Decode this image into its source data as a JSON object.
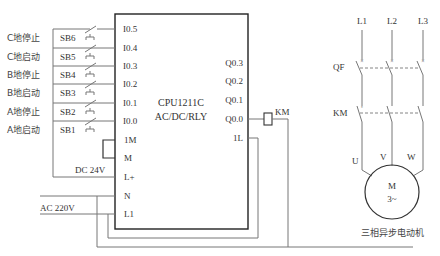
{
  "plc": {
    "model": "CPU1211C",
    "type": "AC/DC/RLY",
    "inputs": [
      "I0.5",
      "I0.4",
      "I0.3",
      "I0.2",
      "I0.1",
      "I0.0"
    ],
    "power_terminals": [
      "1M",
      "M",
      "L+",
      "N",
      "L1"
    ],
    "outputs": [
      "Q0.3",
      "Q0.2",
      "Q0.1",
      "Q0.0"
    ],
    "output_common": "1L"
  },
  "buttons": [
    {
      "label": "C地停止",
      "id": "SB6"
    },
    {
      "label": "C地启动",
      "id": "SB5"
    },
    {
      "label": "B地停止",
      "id": "SB4"
    },
    {
      "label": "B地启动",
      "id": "SB3"
    },
    {
      "label": "A地停止",
      "id": "SB2"
    },
    {
      "label": "A地启动",
      "id": "SB1"
    }
  ],
  "supplies": {
    "dc": "DC 24V",
    "ac": "AC 220V"
  },
  "coil": "KM",
  "motor_circuit": {
    "phases": [
      "L1",
      "L2",
      "L3"
    ],
    "breaker": "QF",
    "contactor": "KM",
    "terminals": [
      "U",
      "V",
      "W"
    ],
    "motor_symbol": "M",
    "motor_sub": "3~",
    "caption": "三相异步电动机"
  }
}
